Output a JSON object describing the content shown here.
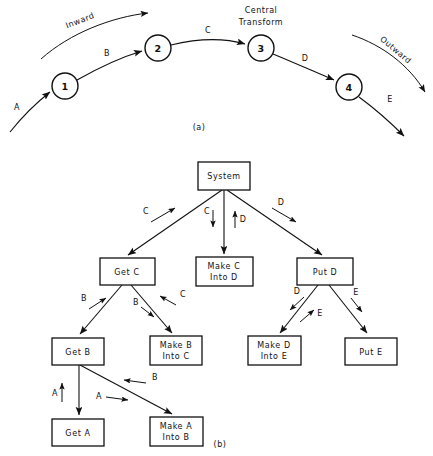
{
  "figure": {
    "background": "#ffffff",
    "ink": "#111111"
  },
  "part_a": {
    "caption": "(a)",
    "annotations": [
      {
        "name": "inward",
        "text": "Inward"
      },
      {
        "name": "central-transform",
        "text_line1": "Central",
        "text_line2": "Transform"
      },
      {
        "name": "outward",
        "text": "Outward"
      }
    ],
    "nodes": [
      {
        "id": "n1",
        "label": "1",
        "cx": 65,
        "cy": 86,
        "r": 13
      },
      {
        "id": "n2",
        "label": "2",
        "cx": 158,
        "cy": 48,
        "r": 13
      },
      {
        "id": "n3",
        "label": "3",
        "cx": 261,
        "cy": 48,
        "r": 13
      },
      {
        "id": "n4",
        "label": "4",
        "cx": 349,
        "cy": 87,
        "r": 13
      }
    ],
    "flows": [
      {
        "id": "fa",
        "label": "A",
        "from": "input",
        "to": "n1"
      },
      {
        "id": "fb",
        "label": "B",
        "from": "n1",
        "to": "n2"
      },
      {
        "id": "fc",
        "label": "C",
        "from": "n2",
        "to": "n3"
      },
      {
        "id": "fd",
        "label": "D",
        "from": "n3",
        "to": "n4"
      },
      {
        "id": "fe",
        "label": "E",
        "from": "n4",
        "to": "output"
      }
    ]
  },
  "part_b": {
    "caption": "(b)",
    "boxes": [
      {
        "id": "system",
        "line1": "System",
        "line2": "",
        "x": 198,
        "y": 162,
        "w": 52,
        "h": 28
      },
      {
        "id": "get-c",
        "line1": "Get C",
        "line2": "",
        "x": 100,
        "y": 258,
        "w": 55,
        "h": 27
      },
      {
        "id": "make-c-d",
        "line1": "Make C",
        "line2": "Into D",
        "x": 196,
        "y": 257,
        "w": 57,
        "h": 29
      },
      {
        "id": "put-d",
        "line1": "Put D",
        "line2": "",
        "x": 297,
        "y": 258,
        "w": 56,
        "h": 27
      },
      {
        "id": "get-b",
        "line1": "Get B",
        "line2": "",
        "x": 52,
        "y": 338,
        "w": 52,
        "h": 27
      },
      {
        "id": "make-b-c",
        "line1": "Make B",
        "line2": "Into C",
        "x": 150,
        "y": 336,
        "w": 52,
        "h": 29
      },
      {
        "id": "make-d-e",
        "line1": "Make D",
        "line2": "Into E",
        "x": 248,
        "y": 336,
        "w": 53,
        "h": 29
      },
      {
        "id": "put-e",
        "line1": "Put E",
        "line2": "",
        "x": 345,
        "y": 338,
        "w": 52,
        "h": 27
      },
      {
        "id": "get-a",
        "line1": "Get A",
        "line2": "",
        "x": 52,
        "y": 419,
        "w": 52,
        "h": 27
      },
      {
        "id": "make-a-b",
        "line1": "Make A",
        "line2": "Into B",
        "x": 150,
        "y": 417,
        "w": 53,
        "h": 29
      }
    ],
    "calls": [
      {
        "id": "system-get-c",
        "from": "system",
        "to": "get-c"
      },
      {
        "id": "system-make-c",
        "from": "system",
        "to": "make-c-d"
      },
      {
        "id": "system-put-d",
        "from": "system",
        "to": "put-d"
      },
      {
        "id": "get-c-get-b",
        "from": "get-c",
        "to": "get-b"
      },
      {
        "id": "get-c-make-b",
        "from": "get-c",
        "to": "make-b-c"
      },
      {
        "id": "put-d-make-d",
        "from": "put-d",
        "to": "make-d-e"
      },
      {
        "id": "put-d-put-e",
        "from": "put-d",
        "to": "put-e"
      },
      {
        "id": "get-b-get-a",
        "from": "get-b",
        "to": "get-a"
      },
      {
        "id": "get-b-make-a",
        "from": "get-b",
        "to": "make-a-b"
      }
    ],
    "couples": [
      {
        "id": "c-up-get-c",
        "label": "C",
        "direction": "up",
        "near": "system-get-c"
      },
      {
        "id": "c-down-make-c",
        "label": "C",
        "direction": "down",
        "near": "system-make-c"
      },
      {
        "id": "d-up-make-c",
        "label": "D",
        "direction": "up",
        "near": "system-make-c"
      },
      {
        "id": "d-down-put-d",
        "label": "D",
        "direction": "down",
        "near": "system-put-d"
      },
      {
        "id": "b-up-get-b",
        "label": "B",
        "direction": "up",
        "near": "get-c-get-b"
      },
      {
        "id": "b-down-make-b",
        "label": "B",
        "direction": "down",
        "near": "get-c-make-b"
      },
      {
        "id": "c-up-make-b",
        "label": "C",
        "direction": "up",
        "near": "get-c-make-b"
      },
      {
        "id": "d-down-make-d",
        "label": "D",
        "direction": "down",
        "near": "put-d-make-d"
      },
      {
        "id": "e-up-make-d",
        "label": "E",
        "direction": "up",
        "near": "put-d-make-d"
      },
      {
        "id": "e-down-put-e",
        "label": "E",
        "direction": "down",
        "near": "put-d-put-e"
      },
      {
        "id": "a-up-get-a",
        "label": "A",
        "direction": "up",
        "near": "get-b-get-a"
      },
      {
        "id": "a-down-make-a",
        "label": "A",
        "direction": "down",
        "near": "get-b-make-a"
      },
      {
        "id": "b-up-make-a",
        "label": "B",
        "direction": "up",
        "near": "get-b-make-a"
      }
    ]
  }
}
